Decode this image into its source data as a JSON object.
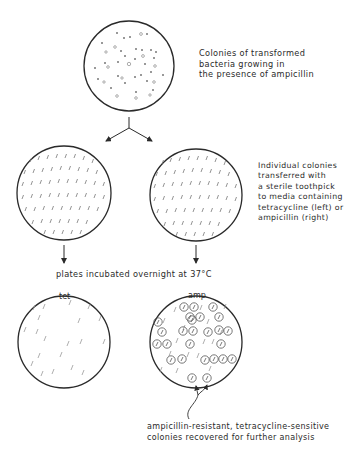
{
  "diagram": {
    "type": "replica plating workflow",
    "plates": {
      "initial": {
        "medium": "ampicillin",
        "description": "Colonies of transformed bacteria growing in the presence of ampicillin"
      },
      "middle_left": {
        "medium": "tetracycline"
      },
      "middle_right": {
        "medium": "ampicillin"
      },
      "final_left": {
        "label": "tet"
      },
      "final_right": {
        "label": "amp"
      }
    }
  },
  "labels": {
    "step1": [
      "Colonies of transformed",
      "bacteria growing in",
      "the presence of ampicillin"
    ],
    "step2": [
      "Individual colonies",
      "transferred with",
      "a sterile toothpick",
      "to media containing",
      "tetracycline (left) or",
      "ampicillin (right)"
    ],
    "step3": "plates incubated overnight at 37°C",
    "tet_plate": "tet",
    "amp_plate": "amp",
    "result": [
      "ampicillin-resistant, tetracycline-sensitive",
      "colonies recovered for further analysis"
    ]
  },
  "colors": {
    "line": "#2a2a2a",
    "colony": "#8a8a8a",
    "background": "#ffffff"
  }
}
